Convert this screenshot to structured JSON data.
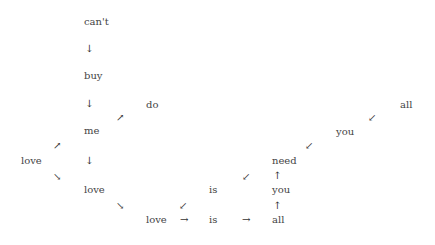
{
  "diagram": {
    "words": [
      {
        "id": "cant",
        "text": "can't"
      },
      {
        "id": "buy",
        "text": "buy"
      },
      {
        "id": "me",
        "text": "me"
      },
      {
        "id": "do",
        "text": "do"
      },
      {
        "id": "love_left",
        "text": "love"
      },
      {
        "id": "love_mid",
        "text": "love"
      },
      {
        "id": "love_bottom",
        "text": "love"
      },
      {
        "id": "is_mid",
        "text": "is"
      },
      {
        "id": "is_bottom",
        "text": "is"
      },
      {
        "id": "all_bottom",
        "text": "all"
      },
      {
        "id": "you_bottom",
        "text": "you"
      },
      {
        "id": "need",
        "text": "need"
      },
      {
        "id": "you_upper",
        "text": "you"
      },
      {
        "id": "all_upper",
        "text": "all"
      }
    ],
    "arrows": {
      "down": "↓",
      "up": "↑",
      "right": "→",
      "up_right": "↗",
      "down_right": "↘",
      "down_left": "↙"
    }
  }
}
